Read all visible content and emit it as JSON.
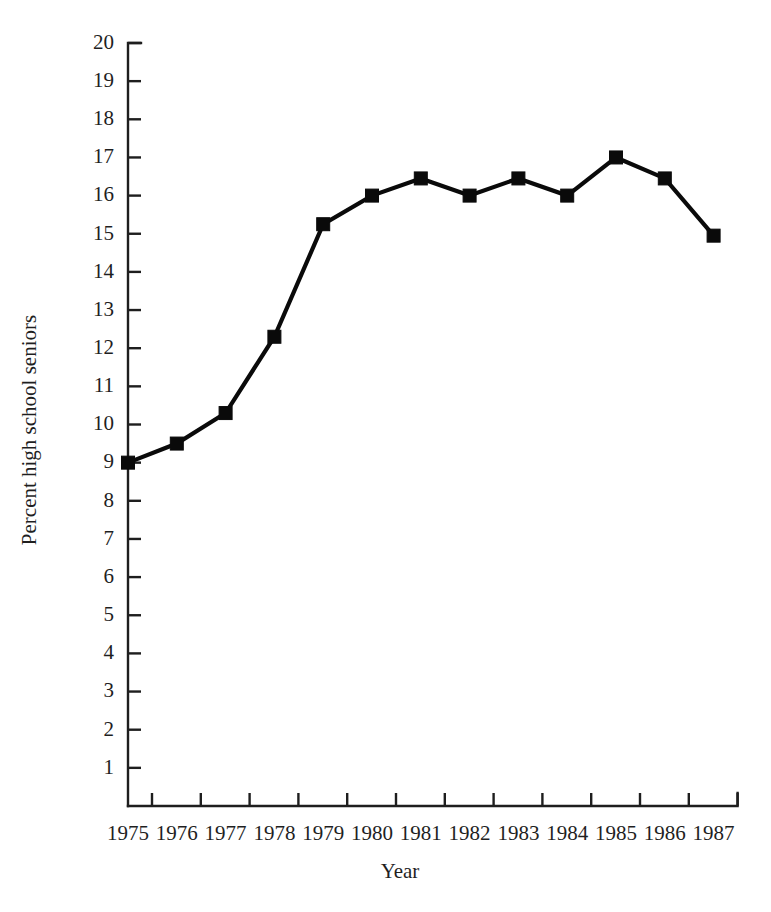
{
  "chart_data": {
    "type": "line",
    "title": "",
    "subtitle": "",
    "xlabel": "Year",
    "ylabel": "Percent high school seniors",
    "categories": [
      "1975",
      "1976",
      "1977",
      "1978",
      "1979",
      "1980",
      "1981",
      "1982",
      "1983",
      "1984",
      "1985",
      "1986",
      "1987"
    ],
    "x": [
      1975,
      1976,
      1977,
      1978,
      1979,
      1980,
      1981,
      1982,
      1983,
      1984,
      1985,
      1986,
      1987
    ],
    "values": [
      9.0,
      9.5,
      10.3,
      12.3,
      15.25,
      16.0,
      16.45,
      16.0,
      16.45,
      16.0,
      17.0,
      16.45,
      14.95
    ],
    "series": [
      {
        "name": "Percent high school seniors",
        "values": [
          9.0,
          9.5,
          10.3,
          12.3,
          15.25,
          16.0,
          16.45,
          16.0,
          16.45,
          16.0,
          17.0,
          16.45,
          14.95
        ],
        "color": "#0a0a0a",
        "marker": "square"
      }
    ],
    "ylim": [
      0,
      20
    ],
    "xlim": [
      1975,
      1987
    ],
    "ytick_labels": [
      "1",
      "2",
      "3",
      "4",
      "5",
      "6",
      "7",
      "8",
      "9",
      "10",
      "11",
      "12",
      "13",
      "14",
      "15",
      "16",
      "17",
      "18",
      "19",
      "20"
    ],
    "ytick_values": [
      1,
      2,
      3,
      4,
      5,
      6,
      7,
      8,
      9,
      10,
      11,
      12,
      13,
      14,
      15,
      16,
      17,
      18,
      19,
      20
    ],
    "xtick_labels": [
      "1975",
      "1976",
      "1977",
      "1978",
      "1979",
      "1980",
      "1981",
      "1982",
      "1983",
      "1984",
      "1985",
      "1986",
      "1987"
    ],
    "grid": false,
    "legend": false,
    "legend_position": "none",
    "annotations": []
  },
  "colors": {
    "background": "#ffffff",
    "axis": "#1e1e1e",
    "series": "#0a0a0a",
    "text": "#1f1f1f"
  }
}
